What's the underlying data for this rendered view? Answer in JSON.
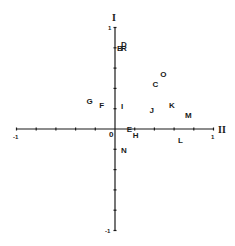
{
  "diagram": {
    "type": "scatter-biplot",
    "axes": {
      "vertical_label": "I",
      "horizontal_label": "II",
      "x_range": [
        -1,
        1
      ],
      "y_range": [
        -1,
        1
      ],
      "tick_step": 0.2,
      "tick_labels": {
        "x_min": "-1",
        "x_max": "1",
        "y_max": "1",
        "y_min": "-1",
        "origin": "0"
      }
    },
    "points": [
      {
        "label": "D",
        "x": 0.09,
        "y": 0.84
      },
      {
        "label": "B",
        "x": 0.05,
        "y": 0.8
      },
      {
        "label": "R",
        "x": 0.09,
        "y": 0.8
      },
      {
        "label": "O",
        "x": 0.49,
        "y": 0.54
      },
      {
        "label": "C",
        "x": 0.41,
        "y": 0.44
      },
      {
        "label": "G",
        "x": -0.26,
        "y": 0.28
      },
      {
        "label": "F",
        "x": -0.13,
        "y": 0.24
      },
      {
        "label": "I",
        "x": 0.09,
        "y": 0.23
      },
      {
        "label": "J",
        "x": 0.38,
        "y": 0.19
      },
      {
        "label": "K",
        "x": 0.58,
        "y": 0.24
      },
      {
        "label": "M",
        "x": 0.74,
        "y": 0.14
      },
      {
        "label": "E",
        "x": 0.15,
        "y": 0.0
      },
      {
        "label": "H",
        "x": 0.21,
        "y": -0.06
      },
      {
        "label": "L",
        "x": 0.67,
        "y": -0.11
      },
      {
        "label": "N",
        "x": 0.09,
        "y": -0.21
      }
    ]
  }
}
